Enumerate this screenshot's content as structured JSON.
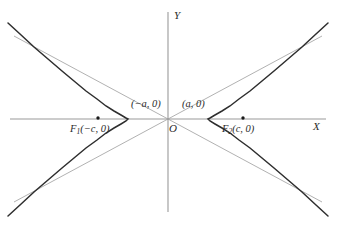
{
  "figure": {
    "background_color": "#ffffff",
    "width": 340,
    "height": 225
  },
  "colors": {
    "curve": "#2e2e2e",
    "asymptote": "#a8a8a8",
    "axis": "#9a9a9a",
    "text": "#2b2b2b",
    "point": "#1a1a1a"
  },
  "axes": {
    "x_label": "X",
    "y_label": "Y",
    "origin_label": "O",
    "x_axis": {
      "x1": 10,
      "y1": 119,
      "x2": 326,
      "y2": 119
    },
    "y_axis": {
      "x1": 168,
      "y1": 12,
      "x2": 168,
      "y2": 212
    }
  },
  "labels": {
    "vertex_left": {
      "text": "(−a, 0)",
      "x": 131,
      "y": 100
    },
    "vertex_right": {
      "text": "(a, 0)",
      "x": 182,
      "y": 100
    },
    "focus_left_prefix": "F",
    "focus_left_sub": "1",
    "focus_left_coords": "(−c, 0)",
    "focus_right_prefix": "F",
    "focus_right_sub": "2",
    "focus_right_coords": "(c, 0)"
  },
  "chart_data": {
    "type": "line",
    "xlabel": "X",
    "ylabel": "Y",
    "grid": false,
    "legend": "none",
    "origin_px": {
      "x": 168,
      "y": 119
    },
    "parameters": {
      "a_px": 40,
      "b_px": 62,
      "c_px": 70
    },
    "vertices": [
      {
        "label": "(−a, 0)",
        "x_px": 128,
        "y_px": 119
      },
      {
        "label": "(a, 0)",
        "x_px": 208,
        "y_px": 119
      }
    ],
    "foci": [
      {
        "label": "F1(−c, 0)",
        "x_px": 98,
        "y_px": 118
      },
      {
        "label": "F2(c, 0)",
        "x_px": 243,
        "y_px": 118
      }
    ],
    "asymptotes": [
      {
        "name": "y = (b/a)x",
        "from_px": [
          14,
          202
        ],
        "to_px": [
          322,
          36
        ]
      },
      {
        "name": "y = −(b/a)x",
        "from_px": [
          14,
          36
        ],
        "to_px": [
          322,
          202
        ]
      }
    ],
    "series": [
      {
        "name": "left-branch",
        "points_px": [
          [
            8,
            23
          ],
          [
            20,
            34
          ],
          [
            34,
            47
          ],
          [
            48,
            59
          ],
          [
            62,
            71
          ],
          [
            74,
            81
          ],
          [
            86,
            91
          ],
          [
            97,
            99
          ],
          [
            106,
            106
          ],
          [
            114,
            111
          ],
          [
            121,
            115
          ],
          [
            126,
            118
          ],
          [
            128,
            119
          ],
          [
            126,
            121
          ],
          [
            121,
            124
          ],
          [
            114,
            128
          ],
          [
            106,
            133
          ],
          [
            97,
            140
          ],
          [
            86,
            148
          ],
          [
            74,
            158
          ],
          [
            62,
            168
          ],
          [
            48,
            180
          ],
          [
            34,
            192
          ],
          [
            20,
            205
          ],
          [
            8,
            216
          ]
        ]
      },
      {
        "name": "right-branch",
        "points_px": [
          [
            328,
            23
          ],
          [
            316,
            34
          ],
          [
            302,
            47
          ],
          [
            288,
            59
          ],
          [
            274,
            71
          ],
          [
            262,
            81
          ],
          [
            250,
            91
          ],
          [
            239,
            99
          ],
          [
            230,
            106
          ],
          [
            222,
            111
          ],
          [
            215,
            115
          ],
          [
            210,
            118
          ],
          [
            208,
            119
          ],
          [
            210,
            121
          ],
          [
            215,
            124
          ],
          [
            222,
            128
          ],
          [
            230,
            133
          ],
          [
            239,
            140
          ],
          [
            250,
            148
          ],
          [
            262,
            158
          ],
          [
            274,
            168
          ],
          [
            288,
            180
          ],
          [
            302,
            192
          ],
          [
            316,
            205
          ],
          [
            328,
            216
          ]
        ]
      }
    ]
  }
}
